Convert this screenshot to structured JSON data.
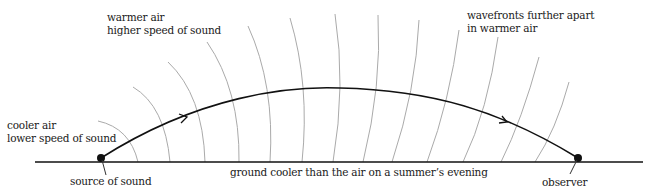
{
  "diagram": {
    "labels": {
      "warmer_air_line1": "warmer air",
      "warmer_air_line2": "higher speed of sound",
      "wavefronts_line1": "wavefronts further apart",
      "wavefronts_line2": "in warmer air",
      "cooler_air_line1": "cooler air",
      "cooler_air_line2": "lower speed of sound",
      "source": "source of sound",
      "ground": "ground cooler than the air on a summer’s evening",
      "observer": "observer"
    },
    "colors": {
      "ray": "#111111",
      "ground": "#111111",
      "wavefront": "#aaaaaa",
      "text": "#1a1a1a"
    },
    "elements": {
      "source_point": {
        "x": 101,
        "y": 158
      },
      "observer_point": {
        "x": 578,
        "y": 158
      },
      "ground_line": {
        "x1": 35,
        "x2": 643,
        "y": 162
      },
      "wavefront_count": 14
    }
  }
}
